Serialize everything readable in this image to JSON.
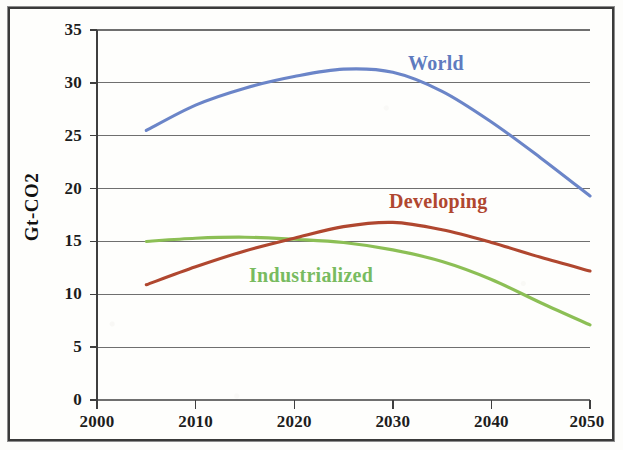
{
  "chart_data": {
    "type": "line",
    "title": "",
    "subtitle": "",
    "xlabel": "",
    "ylabel": "Gt-CO2",
    "xlim": [
      2000,
      2050
    ],
    "ylim": [
      0,
      35
    ],
    "xticks": [
      "2000",
      "2010",
      "2020",
      "2030",
      "2040",
      "2050"
    ],
    "yticks": [
      "0",
      "5",
      "10",
      "15",
      "20",
      "25",
      "30",
      "35"
    ],
    "grid": "horizontal",
    "legend_position": "inline-annotations",
    "x": [
      2005,
      2010,
      2015,
      2020,
      2025,
      2030,
      2035,
      2040,
      2045,
      2050
    ],
    "series": [
      {
        "name": "World",
        "color": "#6b85c8",
        "values": [
          25.5,
          27.9,
          29.5,
          30.6,
          31.3,
          31.0,
          29.2,
          26.3,
          22.9,
          19.3
        ]
      },
      {
        "name": "Developing",
        "color": "#b0472f",
        "values": [
          10.9,
          12.6,
          14.1,
          15.3,
          16.4,
          16.8,
          16.1,
          14.9,
          13.5,
          12.2
        ]
      },
      {
        "name": "Industrialized",
        "color": "#8cbf55",
        "values": [
          15.0,
          15.3,
          15.4,
          15.2,
          14.9,
          14.2,
          13.1,
          11.4,
          9.2,
          7.1
        ]
      }
    ],
    "annotations": [
      {
        "text": "World",
        "color": "#5f7bbf"
      },
      {
        "text": "Developing",
        "color": "#b0472f"
      },
      {
        "text": "Industrialized",
        "color": "#78bb60"
      }
    ]
  },
  "axis": {
    "y_title": "Gt-CO2",
    "y_ticks": [
      "35",
      "30",
      "25",
      "20",
      "15",
      "10",
      "5",
      "0"
    ],
    "x_ticks": [
      "2000",
      "2010",
      "2020",
      "2030",
      "2040",
      "2050"
    ]
  },
  "labels": {
    "world": "World",
    "developing": "Developing",
    "industrialized": "Industrialized"
  },
  "colors": {
    "world": "#6b85c8",
    "developing": "#b0472f",
    "industrialized": "#8cbf55",
    "gridline": "#6f6f6f",
    "axis": "#4a4a4a",
    "frame": "#3a3a3a",
    "paper": "#fdfdfb"
  }
}
